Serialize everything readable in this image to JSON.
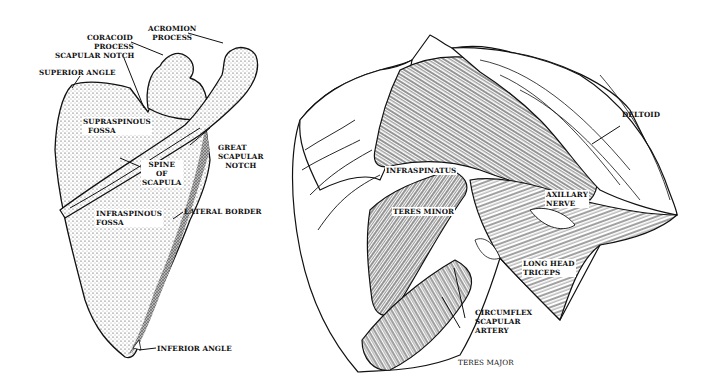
{
  "figure": {
    "left_panel": {
      "subject": "scapula (posterior view)",
      "labels": {
        "coracoid_process_1": "CORACOID",
        "coracoid_process_2": "PROCESS",
        "acromion_process_1": "ACROMION",
        "acromion_process_2": "PROCESS",
        "scapular_notch": "SCAPULAR NOTCH",
        "superior_angle": "SUPERIOR ANGLE",
        "supraspinous_fossa_1": "SUPRASPINOUS",
        "supraspinous_fossa_2": "FOSSA",
        "great_scapular_notch_1": "GREAT",
        "great_scapular_notch_2": "SCAPULAR",
        "great_scapular_notch_3": "NOTCH",
        "spine_of_scapula_1": "SPINE",
        "spine_of_scapula_2": "OF",
        "spine_of_scapula_3": "SCAPULA",
        "infraspinous_fossa_1": "INFRASPINOUS",
        "infraspinous_fossa_2": "FOSSA",
        "lateral_border": "LATERAL BORDER",
        "inferior_angle": "INFERIOR ANGLE"
      }
    },
    "right_panel": {
      "subject": "posterior shoulder muscles",
      "labels": {
        "deltoid": "DELTOID",
        "infraspinatus": "INFRASPINATUS",
        "axillary_nerve_1": "AXILLARY",
        "axillary_nerve_2": "NERVE",
        "teres_minor": "TERES MINOR",
        "long_head_triceps_1": "LONG HEAD",
        "long_head_triceps_2": "TRICEPS",
        "circumflex_scapular_artery_1": "CIRCUMFLEX",
        "circumflex_scapular_artery_2": "SCAPULAR",
        "circumflex_scapular_artery_3": "ARTERY",
        "teres_major": "TERES MAJOR"
      }
    },
    "colors": {
      "ink": "#111111",
      "paper": "#ffffff",
      "shade": "#9a9a9a"
    }
  }
}
